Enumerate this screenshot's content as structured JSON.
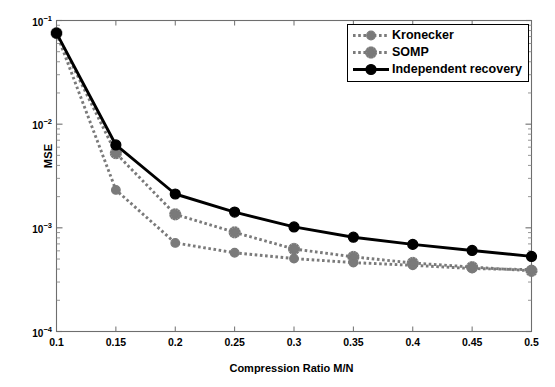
{
  "chart_data": {
    "type": "line",
    "title": "",
    "xlabel": "Compression Ratio M/N",
    "ylabel": "MSE",
    "yscale": "log",
    "xscale": "linear",
    "xlim": [
      0.1,
      0.5
    ],
    "ylim": [
      0.0001,
      0.1
    ],
    "grid": false,
    "legend_position": "top-right",
    "x": [
      0.1,
      0.15,
      0.2,
      0.25,
      0.3,
      0.35,
      0.4,
      0.45,
      0.5
    ],
    "xticks": [
      "0.1",
      "0.15",
      "0.2",
      "0.25",
      "0.3",
      "0.35",
      "0.4",
      "0.45",
      "0.5"
    ],
    "yticks": [
      "10-1",
      "10-2",
      "10-3",
      "10-4"
    ],
    "ytick_values": [
      0.1,
      0.01,
      0.001,
      0.0001
    ],
    "series": [
      {
        "name": "Kronecker",
        "color": "#7a7a7a",
        "linestyle": "dotted",
        "marker": "circle",
        "values": [
          0.0755,
          0.00232,
          0.000715,
          0.000575,
          0.000505,
          0.000462,
          0.000435,
          0.000405,
          0.000395
        ]
      },
      {
        "name": "SOMP",
        "color": "#7a7a7a",
        "linestyle": "dotted",
        "marker": "asterisk",
        "values": [
          0.0755,
          0.00525,
          0.00135,
          0.000905,
          0.000625,
          0.000525,
          0.000458,
          0.000418,
          0.000385
        ]
      },
      {
        "name": "Independent recovery",
        "color": "#000000",
        "linestyle": "solid",
        "marker": "circle",
        "values": [
          0.0755,
          0.0063,
          0.00212,
          0.00142,
          0.00102,
          0.000812,
          0.000692,
          0.000605,
          0.00053
        ]
      }
    ]
  },
  "axes": {
    "ylabel": "MSE",
    "xlabel": "Compression Ratio M/N"
  },
  "legend": {
    "items": [
      {
        "label": "Kronecker"
      },
      {
        "label": "SOMP"
      },
      {
        "label": "Independent recovery"
      }
    ]
  }
}
